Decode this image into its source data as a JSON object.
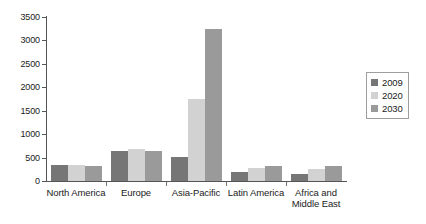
{
  "chart_data": {
    "type": "bar",
    "title": "",
    "subtitle": "",
    "xlabel": "",
    "ylabel": "",
    "ylim": [
      0,
      3500
    ],
    "ytick_step": 500,
    "yticks": [
      "0",
      "500",
      "1000",
      "1500",
      "2000",
      "2500",
      "3000",
      "3500"
    ],
    "grid": false,
    "legend_position": "right",
    "categories": [
      "North America",
      "Europe",
      "Asia-Pacific",
      "Latin America",
      "Africa and\nMiddle East"
    ],
    "series": [
      {
        "name": "2009",
        "color": "#767676",
        "values": [
          350,
          630,
          510,
          200,
          150
        ]
      },
      {
        "name": "2020",
        "color": "#d2d2d2",
        "values": [
          340,
          680,
          1750,
          270,
          250
        ]
      },
      {
        "name": "2030",
        "color": "#9a9a9a",
        "values": [
          330,
          650,
          3250,
          310,
          330
        ]
      }
    ]
  },
  "legend": {
    "items": [
      {
        "label": "2009",
        "color": "#767676"
      },
      {
        "label": "2020",
        "color": "#d2d2d2"
      },
      {
        "label": "2030",
        "color": "#9a9a9a"
      }
    ]
  },
  "colors": {
    "axis": "#555555",
    "text": "#1b1b1b",
    "background": "#ffffff",
    "legend_border": "#9e9e9e"
  }
}
